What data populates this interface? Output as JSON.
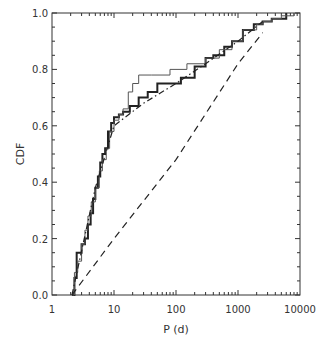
{
  "chart_data": {
    "type": "line",
    "title": "",
    "xlabel": "P (d)",
    "ylabel": "CDF",
    "xscale": "log",
    "xlim": [
      1,
      10000
    ],
    "ylim": [
      0.0,
      1.0
    ],
    "x_tick_labels": [
      "1",
      "10",
      "100",
      "1000",
      "10000"
    ],
    "y_tick_labels": [
      "0.0",
      "0.2",
      "0.4",
      "0.6",
      "0.8",
      "1.0"
    ],
    "grid": false,
    "legend": null,
    "series": [
      {
        "name": "thick-step",
        "style": "solid-thick",
        "x": [
          2.1,
          2.3,
          2.5,
          2.8,
          3.0,
          3.4,
          3.8,
          4.2,
          4.6,
          5.0,
          5.5,
          6.0,
          6.5,
          7.2,
          8.0,
          9.0,
          10,
          12,
          14,
          18,
          25,
          35,
          50,
          80,
          120,
          200,
          300,
          400,
          600,
          800,
          1200,
          1800,
          2500,
          3500,
          6000
        ],
        "y": [
          0.0,
          0.06,
          0.15,
          0.15,
          0.18,
          0.2,
          0.25,
          0.29,
          0.34,
          0.38,
          0.42,
          0.47,
          0.5,
          0.52,
          0.58,
          0.61,
          0.63,
          0.64,
          0.65,
          0.67,
          0.7,
          0.72,
          0.75,
          0.75,
          0.77,
          0.81,
          0.84,
          0.85,
          0.88,
          0.9,
          0.94,
          0.96,
          0.97,
          0.98,
          1.0
        ]
      },
      {
        "name": "thin-step",
        "style": "solid-thin",
        "x": [
          2.1,
          2.3,
          2.6,
          3.0,
          3.4,
          3.8,
          4.3,
          5.0,
          5.8,
          6.5,
          7.5,
          8.5,
          10,
          12,
          14,
          17,
          20,
          25,
          40,
          80,
          150,
          300,
          500,
          800,
          1200,
          2000,
          2500,
          3500,
          5000,
          8000
        ],
        "y": [
          0.0,
          0.08,
          0.12,
          0.18,
          0.23,
          0.28,
          0.33,
          0.38,
          0.44,
          0.48,
          0.52,
          0.58,
          0.62,
          0.64,
          0.66,
          0.72,
          0.75,
          0.78,
          0.78,
          0.8,
          0.82,
          0.84,
          0.87,
          0.9,
          0.94,
          0.96,
          0.97,
          0.98,
          0.99,
          1.0
        ]
      },
      {
        "name": "dash-dot-model",
        "style": "dash-dot",
        "x": [
          2.1,
          5,
          10,
          30,
          100,
          300,
          1000,
          2500
        ],
        "y": [
          0.0,
          0.38,
          0.6,
          0.68,
          0.75,
          0.82,
          0.9,
          0.97
        ]
      },
      {
        "name": "dashed-model",
        "style": "dashed",
        "x": [
          2.1,
          10,
          100,
          1000,
          2500
        ],
        "y": [
          0.0,
          0.2,
          0.48,
          0.82,
          0.93
        ]
      }
    ]
  }
}
